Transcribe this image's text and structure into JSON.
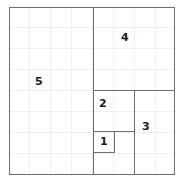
{
  "figure": {
    "kind": "squared-rectangle-diagram",
    "title": "",
    "outer": {
      "x": 9,
      "y": 7,
      "width": 166,
      "height": 168
    },
    "stroke_color": "#6e6e6e",
    "grid_color": "#f0f0f0",
    "grid_spacing": 21,
    "label_color": "#1a1a1a",
    "background_color": "#ffffff"
  },
  "squares": [
    {
      "label": "5",
      "name": "square-5",
      "x": 9,
      "y": 7,
      "width": 85,
      "height": 168,
      "label_x": 35,
      "label_y": 76
    },
    {
      "label": "4",
      "name": "square-4",
      "x": 93,
      "y": 7,
      "width": 82,
      "height": 84,
      "label_x": 121,
      "label_y": 32
    },
    {
      "label": "2",
      "name": "square-2",
      "x": 93,
      "y": 90,
      "width": 42,
      "height": 42,
      "label_x": 99,
      "label_y": 98
    },
    {
      "label": "3",
      "name": "square-3",
      "x": 134,
      "y": 90,
      "width": 41,
      "height": 85,
      "label_x": 142,
      "label_y": 121
    },
    {
      "label": "1",
      "name": "square-1",
      "x": 93,
      "y": 131,
      "width": 22,
      "height": 22,
      "label_x": 100,
      "label_y": 136
    }
  ]
}
